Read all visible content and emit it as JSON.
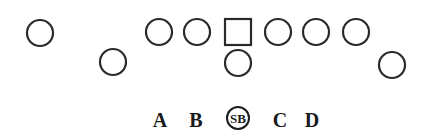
{
  "diagram": {
    "title": "",
    "colors": {
      "stroke": "#2a2a2a",
      "text": "#1a1a1a",
      "background": "#ffffff"
    },
    "players": [
      {
        "id": "p1",
        "shape": "circle",
        "cx": 40,
        "cy": 33,
        "r": 13
      },
      {
        "id": "p2",
        "shape": "circle",
        "cx": 113,
        "cy": 62,
        "r": 13
      },
      {
        "id": "p3",
        "shape": "circle",
        "cx": 159,
        "cy": 32,
        "r": 13
      },
      {
        "id": "p4",
        "shape": "circle",
        "cx": 197,
        "cy": 32,
        "r": 13
      },
      {
        "id": "center",
        "shape": "square",
        "x": 225,
        "y": 19,
        "w": 26,
        "h": 26
      },
      {
        "id": "p5",
        "shape": "circle",
        "cx": 238,
        "cy": 63,
        "r": 13
      },
      {
        "id": "p6",
        "shape": "circle",
        "cx": 278,
        "cy": 32,
        "r": 13
      },
      {
        "id": "p7",
        "shape": "circle",
        "cx": 316,
        "cy": 32,
        "r": 13
      },
      {
        "id": "p8",
        "shape": "circle",
        "cx": 356,
        "cy": 32,
        "r": 13
      },
      {
        "id": "p9",
        "shape": "circle",
        "cx": 392,
        "cy": 65,
        "r": 13
      }
    ],
    "gap_labels": [
      {
        "text": "A",
        "x": 160,
        "y": 127
      },
      {
        "text": "B",
        "x": 196,
        "y": 127
      },
      {
        "text": "C",
        "x": 280,
        "y": 127
      },
      {
        "text": "D",
        "x": 312,
        "y": 127
      }
    ],
    "sb_marker": {
      "text": "SB",
      "cx": 238,
      "cy": 118,
      "r": 11
    }
  }
}
